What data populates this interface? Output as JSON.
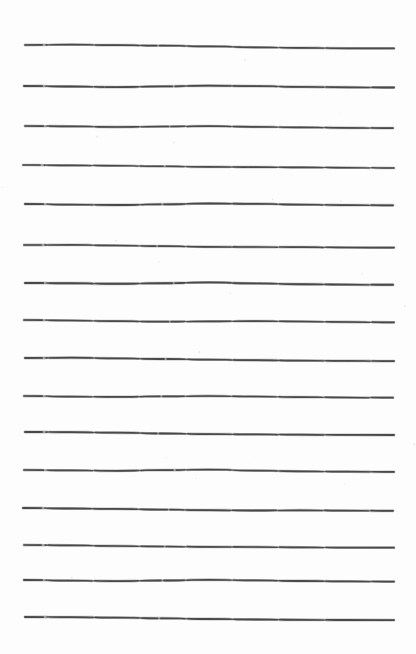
{
  "page": {
    "kind": "ruled-paper-scan",
    "width": 416,
    "height": 654,
    "background_color": "#fdfdfd",
    "ink_color": "#4a4a4a",
    "line_count": 16,
    "left_margin_px": 25,
    "right_margin_px": 394,
    "top_margin_px": 45,
    "average_line_spacing_px": 38,
    "stroke_style": "hand-drawn",
    "text_content": ""
  },
  "lines": [
    {
      "index": 1,
      "y": 45,
      "x_start": 25,
      "x_end": 394,
      "thickness": 1.7,
      "wobble": [
        0.0,
        -0.4,
        0.2,
        0.6,
        1.4,
        2.3,
        2.9,
        3.3,
        3.4
      ],
      "taper_start": 0.35
    },
    {
      "index": 2,
      "y": 86,
      "x_start": 24,
      "x_end": 394,
      "thickness": 1.8,
      "wobble": [
        0.0,
        0.5,
        1.1,
        0.4,
        -0.3,
        0.1,
        0.9,
        1.3,
        1.5
      ],
      "taper_start": 0.4
    },
    {
      "index": 3,
      "y": 126,
      "x_start": 25,
      "x_end": 393,
      "thickness": 1.7,
      "wobble": [
        0.0,
        0.3,
        1.0,
        0.5,
        0.2,
        0.8,
        1.4,
        1.8,
        2.1
      ],
      "taper_start": 0.5
    },
    {
      "index": 4,
      "y": 165,
      "x_start": 23,
      "x_end": 394,
      "thickness": 1.6,
      "wobble": [
        0.0,
        0.4,
        0.7,
        1.3,
        1.9,
        2.1,
        2.4,
        2.7,
        3.0
      ],
      "taper_start": 0.3
    },
    {
      "index": 5,
      "y": 204,
      "x_start": 25,
      "x_end": 393,
      "thickness": 1.8,
      "wobble": [
        0.0,
        0.6,
        1.0,
        0.3,
        -0.5,
        -0.2,
        0.6,
        1.1,
        1.3
      ],
      "taper_start": 0.45
    },
    {
      "index": 6,
      "y": 245,
      "x_start": 24,
      "x_end": 394,
      "thickness": 1.7,
      "wobble": [
        0.0,
        -0.2,
        0.5,
        1.2,
        1.8,
        2.0,
        2.2,
        2.5,
        2.6
      ],
      "taper_start": 0.35
    },
    {
      "index": 7,
      "y": 283,
      "x_start": 25,
      "x_end": 393,
      "thickness": 1.9,
      "wobble": [
        0.0,
        0.3,
        0.8,
        0.2,
        -0.6,
        0.4,
        1.2,
        1.6,
        1.8
      ],
      "taper_start": 0.5
    },
    {
      "index": 8,
      "y": 320,
      "x_start": 24,
      "x_end": 394,
      "thickness": 1.7,
      "wobble": [
        0.0,
        0.5,
        1.2,
        1.7,
        1.4,
        1.1,
        1.5,
        2.0,
        2.3
      ],
      "taper_start": 0.4
    },
    {
      "index": 9,
      "y": 358,
      "x_start": 25,
      "x_end": 394,
      "thickness": 1.8,
      "wobble": [
        0.0,
        -0.3,
        0.4,
        1.0,
        1.6,
        2.2,
        2.6,
        2.9,
        3.1
      ],
      "taper_start": 0.35
    },
    {
      "index": 10,
      "y": 396,
      "x_start": 24,
      "x_end": 393,
      "thickness": 1.7,
      "wobble": [
        0.0,
        0.6,
        0.9,
        0.4,
        0.0,
        0.5,
        1.1,
        1.5,
        1.7
      ],
      "taper_start": 0.45
    },
    {
      "index": 11,
      "y": 432,
      "x_start": 25,
      "x_end": 394,
      "thickness": 1.8,
      "wobble": [
        0.0,
        0.2,
        0.7,
        1.5,
        2.1,
        2.4,
        2.7,
        2.9,
        3.0
      ],
      "taper_start": 0.3
    },
    {
      "index": 12,
      "y": 470,
      "x_start": 24,
      "x_end": 394,
      "thickness": 1.7,
      "wobble": [
        0.0,
        0.4,
        0.8,
        0.1,
        -0.4,
        0.6,
        1.3,
        1.7,
        1.9
      ],
      "taper_start": 0.5
    },
    {
      "index": 13,
      "y": 508,
      "x_start": 23,
      "x_end": 393,
      "thickness": 1.8,
      "wobble": [
        0.0,
        0.5,
        0.9,
        1.6,
        2.2,
        2.5,
        2.3,
        2.6,
        2.8
      ],
      "taper_start": 0.4
    },
    {
      "index": 14,
      "y": 545,
      "x_start": 24,
      "x_end": 394,
      "thickness": 1.7,
      "wobble": [
        0.0,
        0.3,
        1.0,
        1.5,
        1.8,
        2.0,
        2.3,
        2.6,
        2.7
      ],
      "taper_start": 0.35
    },
    {
      "index": 15,
      "y": 580,
      "x_start": 24,
      "x_end": 394,
      "thickness": 1.8,
      "wobble": [
        0.0,
        0.6,
        1.1,
        0.5,
        -0.2,
        0.4,
        1.0,
        1.4,
        1.6
      ],
      "taper_start": 0.45
    },
    {
      "index": 16,
      "y": 617,
      "x_start": 25,
      "x_end": 394,
      "thickness": 1.8,
      "wobble": [
        0.0,
        0.2,
        0.6,
        1.3,
        2.0,
        2.5,
        2.8,
        3.0,
        3.1
      ],
      "taper_start": 0.5
    }
  ]
}
